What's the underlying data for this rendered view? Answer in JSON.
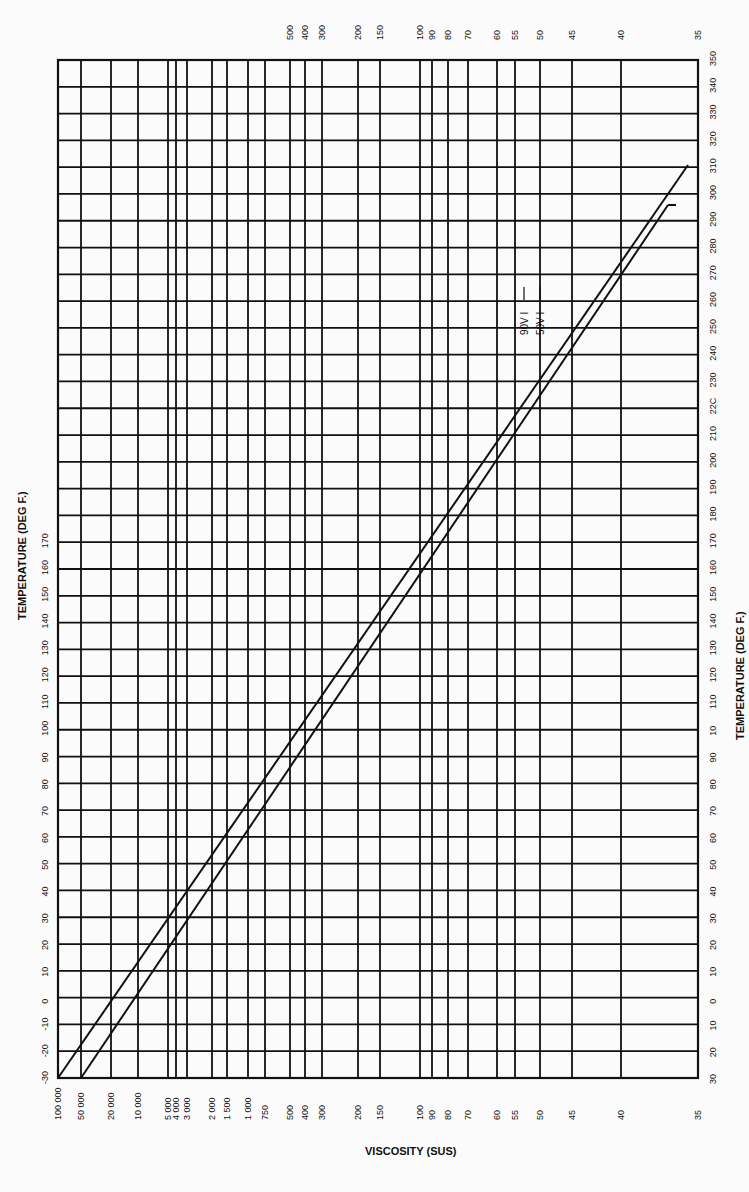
{
  "chart_data": {
    "type": "line",
    "title": "",
    "xlabel": "VISCOSITY (SUS)",
    "ylabel_left": "TEMPERATURE (DEG F.)",
    "ylabel_right": "TEMPERATURE (DEG F.)",
    "orientation": "rotated 90deg (page printed sideways)",
    "grid": true,
    "viscosity_ticks": [
      "100 000",
      "50 000",
      "20 000",
      "10 000",
      "5 000",
      "4 000",
      "3 000",
      "2 000",
      "1 500",
      "1 000",
      "750",
      "500",
      "400",
      "300",
      "200",
      "150",
      "100",
      "90",
      "80",
      "70",
      "60",
      "55",
      "50",
      "45",
      "40",
      "35"
    ],
    "viscosity_ticks_top": [
      "500",
      "400",
      "300",
      "200",
      "150",
      "100",
      "90",
      "80",
      "70",
      "60",
      "55",
      "50",
      "45",
      "40",
      "35"
    ],
    "temperature_ticks_left": [
      "-30",
      "-20",
      "-10",
      "0",
      "10",
      "20",
      "30",
      "40",
      "50",
      "60",
      "70",
      "80",
      "90",
      "100",
      "110",
      "120",
      "130",
      "140",
      "150",
      "160",
      "170"
    ],
    "temperature_ticks_right": [
      "30",
      "20",
      "10",
      "0",
      "10",
      "20",
      "30",
      "40",
      "50",
      "60",
      "70",
      "80",
      "90",
      "10",
      "110",
      "120",
      "130",
      "140",
      "150",
      "160",
      "170",
      "180",
      "190",
      "200",
      "210",
      "22C",
      "230",
      "240",
      "250",
      "260",
      "270",
      "280",
      "290",
      "300",
      "310",
      "320",
      "330",
      "340",
      "350"
    ],
    "temperature_range": [
      -30,
      350
    ],
    "series": [
      {
        "name": "90V I",
        "points": [
          {
            "temp": -30,
            "sus": 100000
          },
          {
            "temp": 0,
            "sus": 9000
          },
          {
            "temp": 50,
            "sus": 1100
          },
          {
            "temp": 100,
            "sus": 250
          },
          {
            "temp": 140,
            "sus": 100
          },
          {
            "temp": 200,
            "sus": 56
          },
          {
            "temp": 250,
            "sus": 45
          },
          {
            "temp": 290,
            "sus": 38
          }
        ]
      },
      {
        "name": "50V I",
        "points": [
          {
            "temp": -30,
            "sus": 50000
          },
          {
            "temp": 0,
            "sus": 6000
          },
          {
            "temp": 50,
            "sus": 1000
          },
          {
            "temp": 100,
            "sus": 240
          },
          {
            "temp": 140,
            "sus": 100
          },
          {
            "temp": 200,
            "sus": 55
          },
          {
            "temp": 250,
            "sus": 43
          },
          {
            "temp": 280,
            "sus": 38
          }
        ]
      }
    ],
    "annotations": [
      "90V I",
      "50V I"
    ]
  },
  "labels": {
    "x_title": "VISCOSITY (SUS)",
    "left_title": "TEMPERATURE (DEG F.)",
    "right_title": "TEMPERATURE (DEG F.)",
    "series_90": "90V I",
    "series_50": "50V I"
  }
}
